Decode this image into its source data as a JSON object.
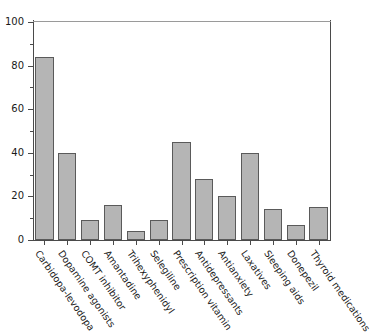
{
  "chart_data": {
    "type": "bar",
    "title": "",
    "subtitle": "",
    "xlabel": "",
    "ylabel": "",
    "ylim": [
      0,
      100
    ],
    "xlim_categories": 13,
    "grid": false,
    "legend": "none",
    "y_major_ticks": [
      "0",
      "20",
      "40",
      "60",
      "80",
      "100"
    ],
    "y_major_values": [
      0,
      20,
      40,
      60,
      80,
      100
    ],
    "y_minor_values": [
      10,
      30,
      50,
      70,
      90
    ],
    "categories": [
      "Carbidopa-levodopa",
      "Dopamine agonists",
      "COMT inhibitor",
      "Amantadine",
      "Trihexyphenidyl",
      "Selegiline",
      "Prescription vitamin",
      "Antidepressants",
      "Antianxiety",
      "Laxatives",
      "Sleeping aids",
      "Donepezil",
      "Thyroid medications"
    ],
    "values": [
      84,
      40,
      9,
      16,
      4,
      9,
      45,
      28,
      20,
      40,
      14,
      7,
      15
    ],
    "bar_fill_color": "#b5b5b5",
    "bar_edge_color": "#5a5a5a",
    "axis_color": "#4a4a4a",
    "background_color": "#ffffff"
  }
}
